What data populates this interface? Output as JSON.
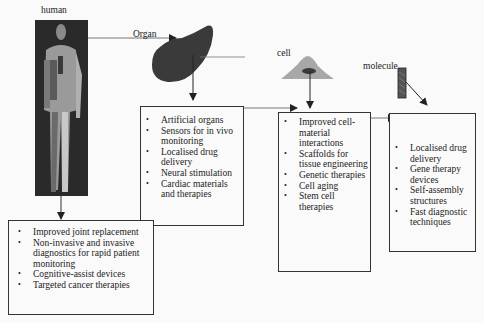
{
  "diagram": {
    "nodes": {
      "human": {
        "label": "human"
      },
      "organ": {
        "label": "Organ"
      },
      "cell": {
        "label": "cell"
      },
      "molecule": {
        "label": "molecule"
      }
    },
    "boxes": {
      "human": {
        "items": [
          "Improved joint replacement",
          "Non-invasive and invasive diagnostics for rapid patient monitoring",
          "Cognitive-assist devices",
          "Targeted cancer therapies"
        ]
      },
      "organ": {
        "items": [
          "Artificial organs",
          "Sensors for in vivo monitoring",
          "Localised drug delivery",
          "Neural stimulation",
          "Cardiac materials and therapies"
        ]
      },
      "cell": {
        "items": [
          "Improved cell-material interactions",
          "Scaffolds for tissue engineering",
          "Genetic therapies",
          "Cell aging",
          "Stem cell therapies"
        ]
      },
      "molecule": {
        "items": [
          "Localised drug delivery",
          "Gene therapy devices",
          "Self-assembly structures",
          "Fast diagnostic techniques"
        ]
      }
    },
    "colors": {
      "organ_fill": "#3a3a3a",
      "cell_fill": "#a8a8a8",
      "nucleus_fill": "#3a3a3a",
      "molecule_fill": "#555555",
      "line": "#333333"
    }
  }
}
